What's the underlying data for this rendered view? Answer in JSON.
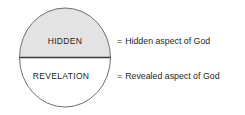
{
  "diagram": {
    "circle": {
      "top_half_label": "HIDDEN",
      "bottom_half_label": "REVELATION",
      "top_half_fill": "#e3e3e3",
      "bottom_half_fill": "#ffffff",
      "outline_color": "#6f6f6f",
      "divider_color": "#3a3a3a"
    },
    "legend": {
      "equals_sign": "=",
      "items": [
        {
          "equals": "=",
          "text": "Hidden aspect of God"
        },
        {
          "equals": "=",
          "text": "Revealed aspect of God"
        }
      ]
    }
  }
}
